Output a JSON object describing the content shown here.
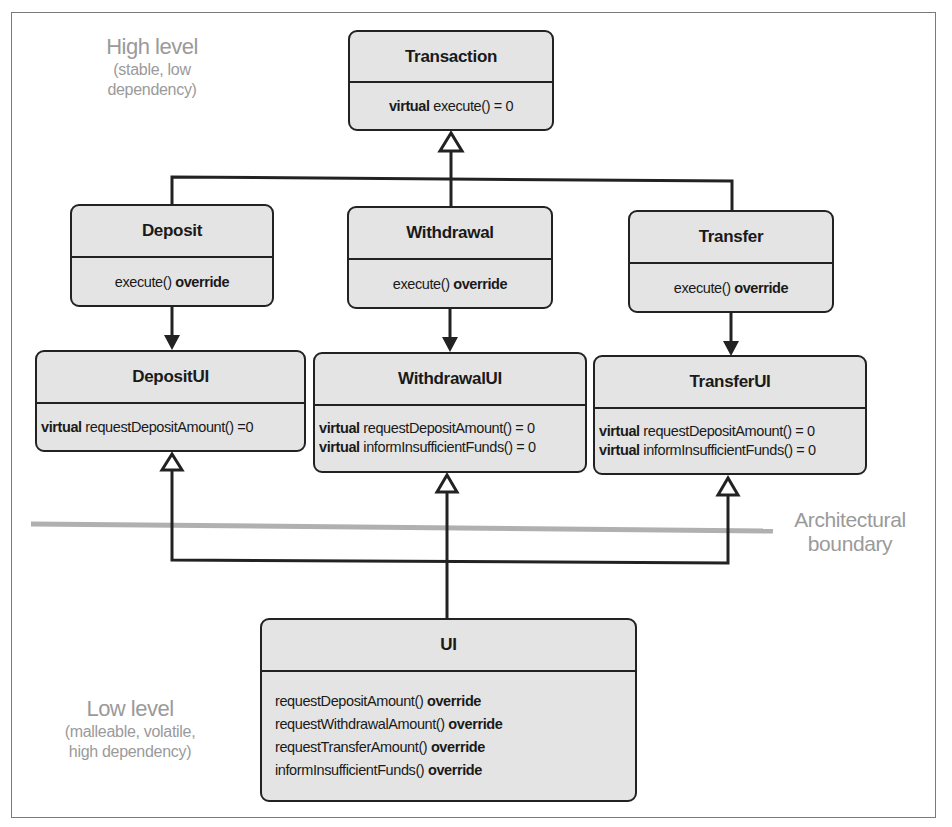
{
  "annotations": {
    "high_level": {
      "title": "High level",
      "line1": "(stable, low",
      "line2": "dependency)"
    },
    "low_level": {
      "title": "Low level",
      "line1": "(malleable, volatile,",
      "line2": "high dependency)"
    },
    "boundary": {
      "line1": "Architectural",
      "line2": "boundary"
    }
  },
  "classes": {
    "transaction": {
      "name": "Transaction",
      "members": [
        {
          "keyword": "virtual",
          "text": "execute() = 0"
        }
      ]
    },
    "deposit": {
      "name": "Deposit",
      "members": [
        {
          "text": "execute()",
          "keyword": "override"
        }
      ]
    },
    "withdrawal": {
      "name": "Withdrawal",
      "members": [
        {
          "text": "execute()",
          "keyword": "override"
        }
      ]
    },
    "transfer": {
      "name": "Transfer",
      "members": [
        {
          "text": "execute()",
          "keyword": "override"
        }
      ]
    },
    "deposit_ui": {
      "name": "DepositUI",
      "members": [
        {
          "keyword": "virtual",
          "text": "requestDepositAmount() =0"
        }
      ]
    },
    "withdrawal_ui": {
      "name": "WithdrawalUI",
      "members": [
        {
          "keyword": "virtual",
          "text": "requestDepositAmount() = 0"
        },
        {
          "keyword": "virtual",
          "text": "informInsufficientFunds() = 0"
        }
      ]
    },
    "transfer_ui": {
      "name": "TransferUI",
      "members": [
        {
          "keyword": "virtual",
          "text": "requestDepositAmount() = 0"
        },
        {
          "keyword": "virtual",
          "text": "informInsufficientFunds() = 0"
        }
      ]
    },
    "ui": {
      "name": "UI",
      "members": [
        {
          "text": "requestDepositAmount()",
          "keyword": "override"
        },
        {
          "text": "requestWithdrawalAmount()",
          "keyword": "override"
        },
        {
          "text": "requestTransferAmount()",
          "keyword": "override"
        },
        {
          "text": "informInsufficientFunds()",
          "keyword": "override"
        }
      ]
    }
  },
  "relationships": [
    {
      "from": "Deposit",
      "to": "Transaction",
      "type": "inheritance"
    },
    {
      "from": "Withdrawal",
      "to": "Transaction",
      "type": "inheritance"
    },
    {
      "from": "Transfer",
      "to": "Transaction",
      "type": "inheritance"
    },
    {
      "from": "Deposit",
      "to": "DepositUI",
      "type": "dependency"
    },
    {
      "from": "Withdrawal",
      "to": "WithdrawalUI",
      "type": "dependency"
    },
    {
      "from": "Transfer",
      "to": "TransferUI",
      "type": "dependency"
    },
    {
      "from": "UI",
      "to": "DepositUI",
      "type": "inheritance"
    },
    {
      "from": "UI",
      "to": "WithdrawalUI",
      "type": "inheritance"
    },
    {
      "from": "UI",
      "to": "TransferUI",
      "type": "inheritance"
    }
  ],
  "colors": {
    "box_fill": "#e4e4e4",
    "line": "#222222",
    "annotation": "#9a9a9a",
    "boundary_line": "#b0b0b0"
  }
}
